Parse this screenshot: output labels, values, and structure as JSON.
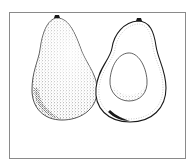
{
  "illustration": {
    "subject": "Avocado illustration: whole fruit and halved fruit with pit",
    "style": "pen-and-ink stipple drawing",
    "colors": {
      "ink": "#1a1a1a",
      "frame": "#8a8a8a",
      "background": "#ffffff"
    },
    "items": [
      {
        "label": "whole avocado"
      },
      {
        "label": "halved avocado"
      },
      {
        "label": "pit"
      }
    ]
  }
}
